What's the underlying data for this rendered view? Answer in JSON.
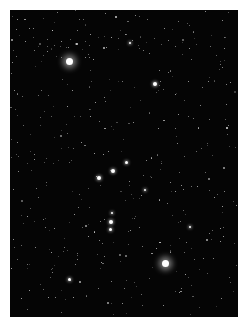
{
  "image": {
    "subject": "night sky star field",
    "background_color": "#050505",
    "star_color": "#ffffff"
  },
  "stars": [
    {
      "x": 69,
      "y": 61,
      "size": 7,
      "type": "bright"
    },
    {
      "x": 155,
      "y": 84,
      "size": 4,
      "type": "med"
    },
    {
      "x": 165,
      "y": 263,
      "size": 7,
      "type": "bright"
    },
    {
      "x": 99,
      "y": 178,
      "size": 4,
      "type": "med"
    },
    {
      "x": 113,
      "y": 171,
      "size": 4,
      "type": "med"
    },
    {
      "x": 126,
      "y": 162,
      "size": 3,
      "type": "med"
    },
    {
      "x": 111,
      "y": 222,
      "size": 4,
      "type": "med"
    },
    {
      "x": 110,
      "y": 229,
      "size": 3,
      "type": "med"
    },
    {
      "x": 112,
      "y": 213,
      "size": 2,
      "type": "med"
    },
    {
      "x": 69,
      "y": 279,
      "size": 3,
      "type": "med"
    },
    {
      "x": 190,
      "y": 227,
      "size": 2,
      "type": "med"
    },
    {
      "x": 145,
      "y": 190,
      "size": 2,
      "type": "med"
    },
    {
      "x": 130,
      "y": 43,
      "size": 2,
      "type": "med"
    },
    {
      "x": 52,
      "y": 30,
      "size": 1,
      "type": "faint"
    }
  ]
}
